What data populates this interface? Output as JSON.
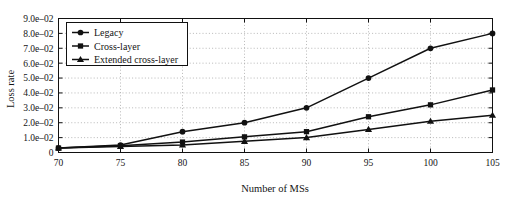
{
  "chart_data": {
    "type": "line",
    "title": "",
    "xlabel": "Number of MSs",
    "ylabel": "Loss rate",
    "x": [
      70,
      75,
      80,
      85,
      90,
      95,
      100,
      105
    ],
    "xtick_labels": [
      "70",
      "75",
      "80",
      "85",
      "90",
      "95",
      "100",
      "105"
    ],
    "xlim": [
      70,
      105
    ],
    "ylim": [
      0,
      0.09
    ],
    "ytick_values": [
      0,
      0.01,
      0.02,
      0.03,
      0.04,
      0.05,
      0.06,
      0.07,
      0.08,
      0.09
    ],
    "ytick_labels": [
      "0",
      "1.0e–02",
      "2.0e–02",
      "3.0e–02",
      "4.0e–02",
      "5.0e–02",
      "6.0e–02",
      "7.0e–02",
      "8.0e–02",
      "9.0e–02"
    ],
    "grid": true,
    "grid_style": "dotted",
    "legend_position": "upper-left-inset",
    "series": [
      {
        "name": "Legacy",
        "marker": "circle",
        "color": "#111111",
        "values": [
          0.003,
          0.005,
          0.014,
          0.02,
          0.03,
          0.05,
          0.07,
          0.08
        ]
      },
      {
        "name": "Cross-layer",
        "marker": "square",
        "color": "#111111",
        "values": [
          0.003,
          0.0045,
          0.007,
          0.0105,
          0.014,
          0.024,
          0.032,
          0.042
        ]
      },
      {
        "name": "Extended cross-layer",
        "marker": "triangle",
        "color": "#111111",
        "values": [
          0.003,
          0.004,
          0.005,
          0.0075,
          0.01,
          0.0155,
          0.021,
          0.025
        ]
      }
    ]
  },
  "legend": {
    "entries": [
      {
        "label": "Legacy",
        "marker": "circle"
      },
      {
        "label": "Cross-layer",
        "marker": "square"
      },
      {
        "label": "Extended cross-layer",
        "marker": "triangle"
      }
    ]
  }
}
